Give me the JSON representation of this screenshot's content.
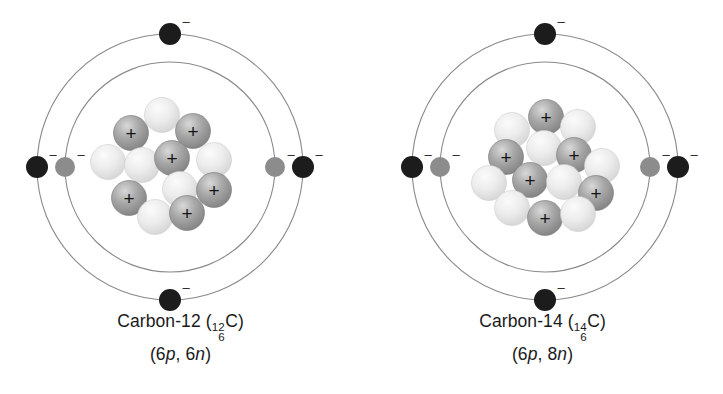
{
  "figure": {
    "type": "atomic-structure-diagram",
    "background_color": "#ffffff",
    "atoms": [
      {
        "id": "c12",
        "name": "Carbon-12",
        "caption_name": "Carbon-12",
        "symbol": "C",
        "mass_number": "12",
        "atomic_number": "6",
        "composition": "(6p, 6n)",
        "composition_parts": {
          "open": "(",
          "proton_count": "6",
          "proton_symbol": "p",
          "separator": ", ",
          "neutron_count": "6",
          "neutron_symbol": "n",
          "close": ")"
        },
        "protons": 6,
        "neutrons": 6,
        "electrons": 6,
        "shells": [
          {
            "name": "inner-shell",
            "radius": 105,
            "electron_count": 2,
            "electron_color": "#8c8c8c"
          },
          {
            "name": "outer-shell",
            "radius": 133,
            "electron_count": 4,
            "electron_color": "#1c1c1c"
          }
        ]
      },
      {
        "id": "c14",
        "name": "Carbon-14",
        "caption_name": "Carbon-14",
        "symbol": "C",
        "mass_number": "14",
        "atomic_number": "6",
        "composition": "(6p, 8n)",
        "composition_parts": {
          "open": "(",
          "proton_count": "6",
          "proton_symbol": "p",
          "separator": ", ",
          "neutron_count": "8",
          "neutron_symbol": "n",
          "close": ")"
        },
        "protons": 6,
        "neutrons": 8,
        "electrons": 6,
        "shells": [
          {
            "name": "inner-shell",
            "radius": 105,
            "electron_count": 2,
            "electron_color": "#8c8c8c"
          },
          {
            "name": "outer-shell",
            "radius": 133,
            "electron_count": 4,
            "electron_color": "#1c1c1c"
          }
        ]
      }
    ],
    "glyphs": {
      "proton_charge": "+",
      "electron_charge": "–"
    },
    "colors": {
      "orbit_stroke": "#8a8a8a",
      "proton_fill": "#9a9a9a",
      "proton_highlight": "#c9c9c9",
      "neutron_fill": "#e2e2e2",
      "neutron_highlight": "#f7f7f7",
      "electron_outer": "#1c1c1c",
      "electron_inner": "#8c8c8c",
      "text": "#1a1a1a"
    },
    "layout": {
      "center_x": 170,
      "center_y": 167,
      "nucleon_radius": 17.5
    },
    "nucleons_c12": [
      {
        "type": "neutron",
        "x": 162,
        "y": 115
      },
      {
        "type": "proton",
        "x": 131,
        "y": 133
      },
      {
        "type": "proton",
        "x": 193,
        "y": 131
      },
      {
        "type": "neutron",
        "x": 108,
        "y": 162
      },
      {
        "type": "neutron",
        "x": 142,
        "y": 165
      },
      {
        "type": "proton",
        "x": 172,
        "y": 158
      },
      {
        "type": "neutron",
        "x": 214,
        "y": 160
      },
      {
        "type": "neutron",
        "x": 180,
        "y": 189
      },
      {
        "type": "proton",
        "x": 214,
        "y": 190
      },
      {
        "type": "proton",
        "x": 129,
        "y": 198
      },
      {
        "type": "neutron",
        "x": 155,
        "y": 217
      },
      {
        "type": "proton",
        "x": 187,
        "y": 213
      }
    ],
    "nucleons_c14": [
      {
        "type": "proton",
        "x": 546,
        "y": 117
      },
      {
        "type": "neutron",
        "x": 512,
        "y": 130
      },
      {
        "type": "neutron",
        "x": 578,
        "y": 127
      },
      {
        "type": "neutron",
        "x": 544,
        "y": 148
      },
      {
        "type": "proton",
        "x": 506,
        "y": 157
      },
      {
        "type": "proton",
        "x": 574,
        "y": 155
      },
      {
        "type": "neutron",
        "x": 602,
        "y": 166
      },
      {
        "type": "neutron",
        "x": 489,
        "y": 183
      },
      {
        "type": "proton",
        "x": 530,
        "y": 180
      },
      {
        "type": "neutron",
        "x": 564,
        "y": 182
      },
      {
        "type": "proton",
        "x": 596,
        "y": 193
      },
      {
        "type": "neutron",
        "x": 512,
        "y": 208
      },
      {
        "type": "proton",
        "x": 545,
        "y": 218
      },
      {
        "type": "neutron",
        "x": 578,
        "y": 214
      }
    ]
  }
}
